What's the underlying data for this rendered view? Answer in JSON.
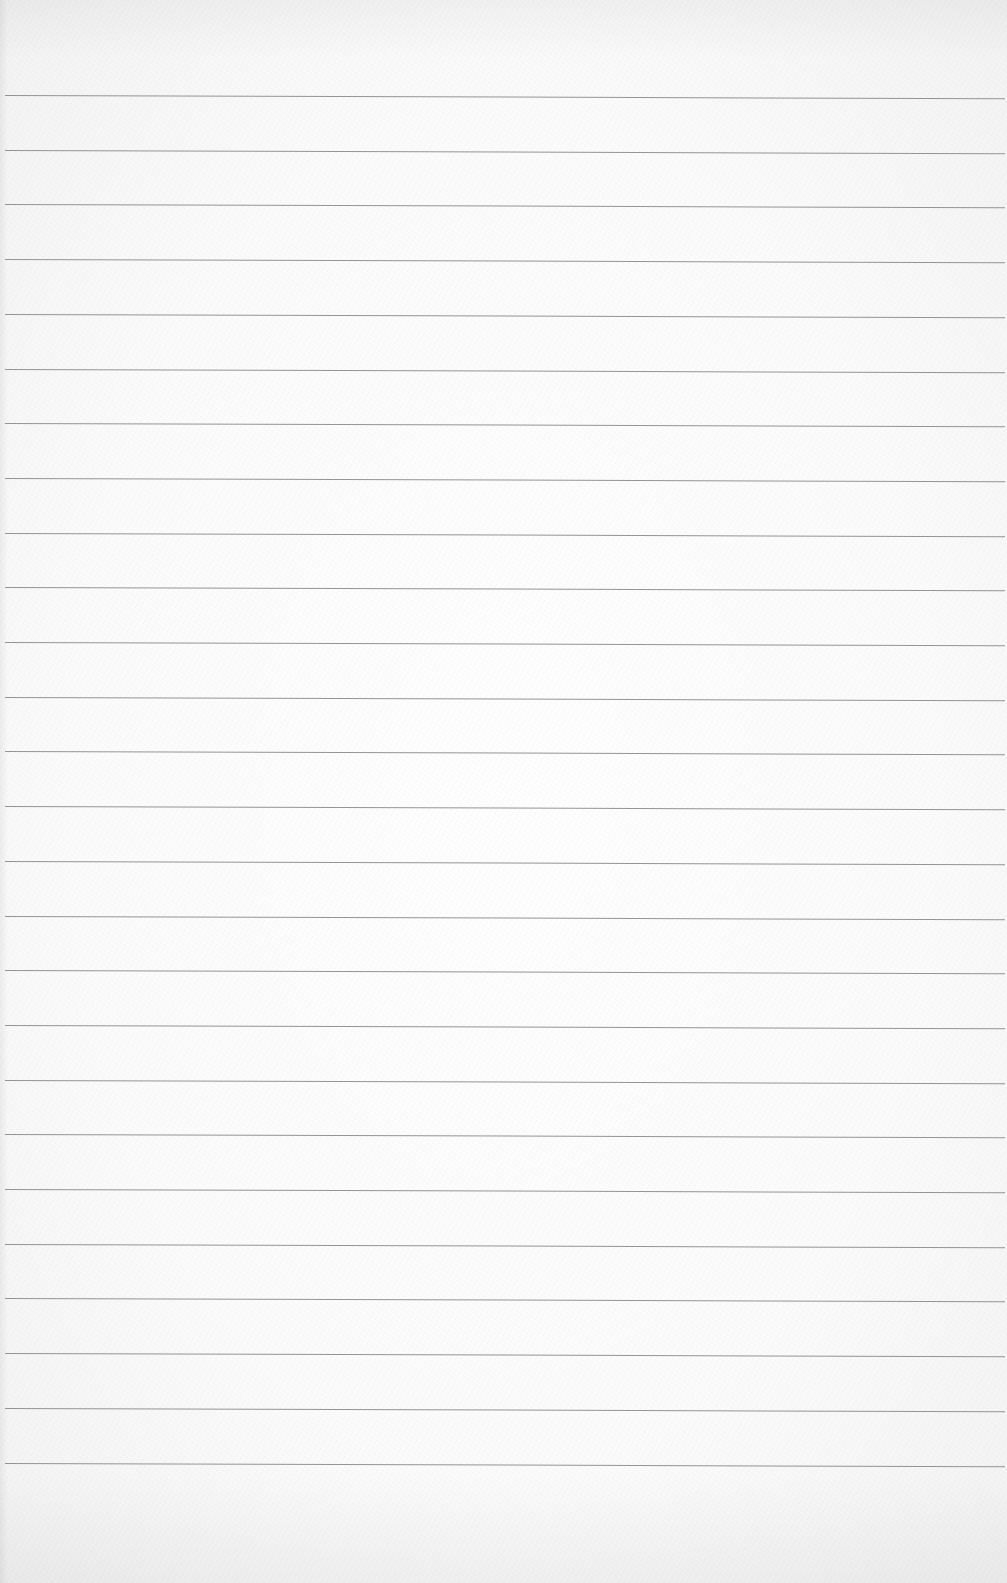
{
  "page": {
    "type": "lined-paper",
    "background_color": "#fbfbfb",
    "line_color": "#8a8a8a",
    "line_count": 26,
    "first_line_y": 95,
    "line_spacing": 54.7,
    "line_left_x": 5,
    "text_content": []
  }
}
